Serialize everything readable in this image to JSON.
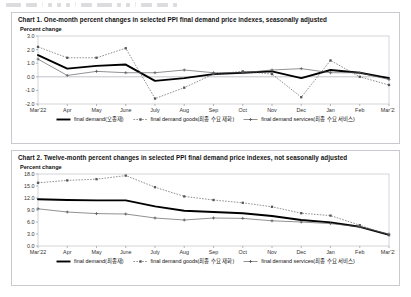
{
  "toolbar": {
    "present": true,
    "description": "partially cropped application toolbar"
  },
  "chart1": {
    "title": "Chart 1. One-month percent changes in selected PPI final demand price indexes, seasonally adjusted",
    "axis_label": "Percent change",
    "legend": [
      {
        "label": "final demand(오종재)",
        "style": "solid-thick",
        "color": "#000000"
      },
      {
        "label": "final demand goods(최종 수요 재화)",
        "style": "dotted-square",
        "color": "#555555"
      },
      {
        "label": "final demand services(최종 수요 서비스)",
        "style": "solid-thin-plus",
        "color": "#555555"
      }
    ]
  },
  "chart2": {
    "title": "Chart 2. Twelve-month percent changes in selected PPI final demand price indexes, not seasonally adjusted",
    "axis_label": "Percent change",
    "legend": [
      {
        "label": "final demand(최종재)",
        "style": "solid-thick",
        "color": "#000000"
      },
      {
        "label": "final demand goods(최종 수요 재화)",
        "style": "dotted-square",
        "color": "#555555"
      },
      {
        "label": "final demand services(최종 수요 서비스)",
        "style": "solid-thin-plus",
        "color": "#555555"
      }
    ]
  },
  "chart_data": [
    {
      "id": "chart1",
      "type": "line",
      "title": "Chart 1. One-month percent changes in selected PPI final demand price indexes, seasonally adjusted",
      "ylabel": "Percent change",
      "xlabel": "",
      "grid": false,
      "legend_position": "bottom",
      "categories": [
        "Mar'22",
        "Apr",
        "May",
        "June",
        "July",
        "Aug",
        "Sep",
        "Oct",
        "Nov",
        "Dec",
        "Jan",
        "Feb",
        "Mar'23"
      ],
      "ylim": [
        -2.0,
        3.0
      ],
      "yticks": [
        -2.0,
        -1.0,
        0.0,
        1.0,
        2.0,
        3.0
      ],
      "ytick_labels": [
        "-2.0",
        "-1.0",
        "0.0",
        "1.0",
        "2.0",
        "3.0"
      ],
      "zero_line": 0.0,
      "series": [
        {
          "name": "final demand(오종재)",
          "style": "solid-thick",
          "color": "#000000",
          "values": [
            1.6,
            0.6,
            0.8,
            0.9,
            -0.3,
            -0.1,
            0.2,
            0.3,
            0.4,
            -0.1,
            0.5,
            0.3,
            -0.1
          ]
        },
        {
          "name": "final demand goods(최종 수요 재화)",
          "style": "dotted-square",
          "color": "#555555",
          "values": [
            2.2,
            1.4,
            1.4,
            2.1,
            -1.6,
            -0.8,
            0.2,
            0.4,
            0.2,
            -1.5,
            1.2,
            0.0,
            -0.6
          ]
        },
        {
          "name": "final demand services(최종 수요 서비스)",
          "style": "solid-thin-plus",
          "color": "#555555",
          "values": [
            1.3,
            0.1,
            0.4,
            0.3,
            0.3,
            0.5,
            0.3,
            0.3,
            0.5,
            0.6,
            0.3,
            0.3,
            -0.2
          ]
        }
      ]
    },
    {
      "id": "chart2",
      "type": "line",
      "title": "Chart 2. Twelve-month percent changes in selected PPI final demand price indexes, not seasonally adjusted",
      "ylabel": "Percent change",
      "xlabel": "",
      "grid": false,
      "legend_position": "bottom",
      "categories": [
        "Mar'22",
        "Apr",
        "May",
        "June",
        "July",
        "Aug",
        "Sep",
        "Oct",
        "Nov",
        "Dec",
        "Jan",
        "Feb",
        "Mar'23"
      ],
      "ylim": [
        0.0,
        18.0
      ],
      "yticks": [
        0.0,
        3.0,
        6.0,
        9.0,
        12.0,
        15.0,
        18.0
      ],
      "ytick_labels": [
        "0.0",
        "3.0",
        "6.0",
        "9.0",
        "12.0",
        "15.0",
        "18.0"
      ],
      "series": [
        {
          "name": "final demand(최종재)",
          "style": "solid-thick",
          "color": "#000000",
          "values": [
            11.7,
            11.5,
            11.4,
            11.4,
            9.9,
            8.8,
            8.5,
            8.2,
            7.5,
            6.5,
            5.9,
            4.8,
            2.8
          ]
        },
        {
          "name": "final demand goods(최종 수요 재화)",
          "style": "dotted-square",
          "color": "#555555",
          "values": [
            15.8,
            16.4,
            16.7,
            17.6,
            14.7,
            12.4,
            11.5,
            10.8,
            9.8,
            8.2,
            7.6,
            5.2,
            2.7
          ]
        },
        {
          "name": "final demand services(최종 수요 서비스)",
          "style": "solid-thin-plus",
          "color": "#555555",
          "values": [
            9.3,
            8.5,
            8.1,
            8.0,
            7.0,
            6.5,
            7.0,
            6.9,
            6.3,
            6.0,
            5.6,
            4.8,
            3.0
          ]
        }
      ]
    }
  ]
}
